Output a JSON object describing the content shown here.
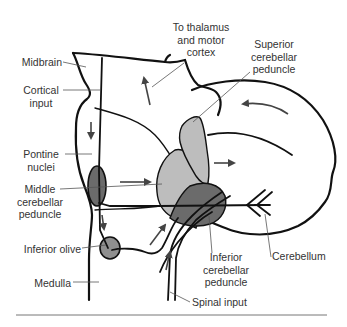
{
  "diagram": {
    "type": "anatomical",
    "colors": {
      "outline": "#111111",
      "dark_gray": "#6b6b6b",
      "medium_gray": "#8f8f8f",
      "light_gray": "#bdbdbd",
      "arrow": "#444444",
      "leader": "#555555"
    },
    "labels": {
      "midbrain": "Midbrain",
      "cortical_input_1": "Cortical",
      "cortical_input_2": "input",
      "pontine_1": "Pontine",
      "pontine_2": "nuclei",
      "middle_1": "Middle",
      "middle_2": "cerebellar",
      "middle_3": "peduncle",
      "inferior_olive": "Inferior olive",
      "medulla": "Medulla",
      "thalamus_1": "To thalamus",
      "thalamus_2": "and motor",
      "thalamus_3": "cortex",
      "superior_1": "Superior",
      "superior_2": "cerebellar",
      "superior_3": "peduncle",
      "inferior_ped_1": "Inferior",
      "inferior_ped_2": "cerebellar",
      "inferior_ped_3": "peduncle",
      "cerebellum": "Cerebellum",
      "spinal_input": "Spinal input"
    }
  }
}
